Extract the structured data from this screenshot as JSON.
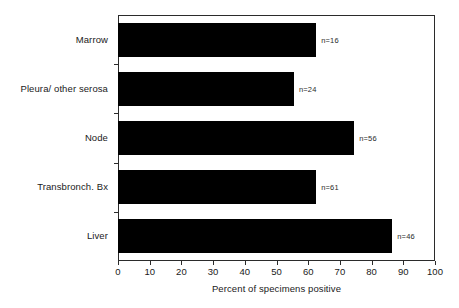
{
  "chart_data": {
    "type": "bar",
    "orientation": "horizontal",
    "title": "",
    "xlabel": "Percent of specimens positive",
    "ylabel": "",
    "xlim": [
      0,
      100
    ],
    "xticks": [
      0,
      10,
      20,
      30,
      40,
      50,
      60,
      70,
      80,
      90,
      100
    ],
    "grid": false,
    "legend": false,
    "categories": [
      "Marrow",
      "Pleura/ other serosa",
      "Node",
      "Transbronch. Bx",
      "Liver"
    ],
    "values": [
      62.5,
      55.5,
      74.5,
      62.5,
      86.5
    ],
    "annotations": [
      "n=16",
      "n=24",
      "n=56",
      "n=61",
      "n=46"
    ],
    "bar_color": "#000000",
    "axis_color": "#2b2b2b"
  },
  "bars": [
    {
      "label": "Marrow",
      "value": 62.5,
      "n_label": "n=16"
    },
    {
      "label": "Pleura/ other serosa",
      "value": 55.5,
      "n_label": "n=24"
    },
    {
      "label": "Node",
      "value": 74.5,
      "n_label": "n=56"
    },
    {
      "label": "Transbronch. Bx",
      "value": 62.5,
      "n_label": "n=61"
    },
    {
      "label": "Liver",
      "value": 86.5,
      "n_label": "n=46"
    }
  ],
  "xaxis": {
    "title": "Percent of specimens positive",
    "ticks": [
      "0",
      "10",
      "20",
      "30",
      "40",
      "50",
      "60",
      "70",
      "80",
      "90",
      "100"
    ]
  }
}
